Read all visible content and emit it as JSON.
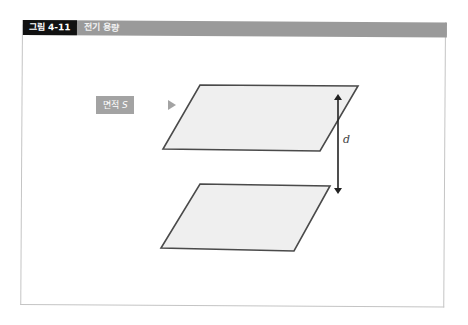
{
  "figure": {
    "number_label": "그림 4-11",
    "title": "전기 용량"
  },
  "diagram": {
    "area_label_text": "면적",
    "area_label_symbol": "S",
    "distance_label": "d",
    "plate_fill": "#efefef",
    "plate_stroke": "#4a4a4a",
    "header_color": "#9a9a9a",
    "label_bg": "#111111",
    "callout_color": "#a3a3a3"
  }
}
